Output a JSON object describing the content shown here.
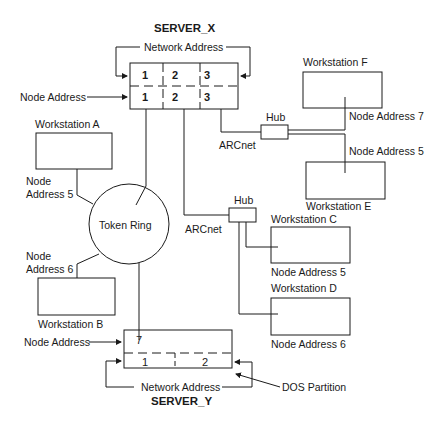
{
  "diagram": {
    "server_x": {
      "title": "SERVER_X",
      "network_address_label": "Network Address",
      "node_address_label": "Node Address",
      "network_row": [
        "1",
        "2",
        "3"
      ],
      "node_row": [
        "1",
        "2",
        "3"
      ]
    },
    "server_y": {
      "title": "SERVER_Y",
      "node_address_label": "Node Address",
      "network_address_label": "Network Address",
      "dos_partition_label": "DOS Partition",
      "node_row": [
        "7"
      ],
      "network_row": [
        "1",
        "2"
      ]
    },
    "token_ring": {
      "label": "Token Ring"
    },
    "hubs": [
      {
        "label": "Hub",
        "network_label": "ARCnet"
      },
      {
        "label": "Hub",
        "network_label": "ARCnet"
      }
    ],
    "workstations": [
      {
        "name": "Workstation A",
        "node_label_line1": "Node",
        "node_label_line2": "Address 5"
      },
      {
        "name": "Workstation B",
        "node_label_line1": "Node",
        "node_label_line2": "Address 6"
      },
      {
        "name": "Workstation C",
        "node_label": "Node Address 5"
      },
      {
        "name": "Workstation D",
        "node_label": "Node Address 6"
      },
      {
        "name": "Workstation E",
        "node_label": "Node Address 5"
      },
      {
        "name": "Workstation F",
        "node_label": "Node Address 7"
      }
    ],
    "colors": {
      "line": "#1a1a1a",
      "background": "#ffffff"
    }
  }
}
